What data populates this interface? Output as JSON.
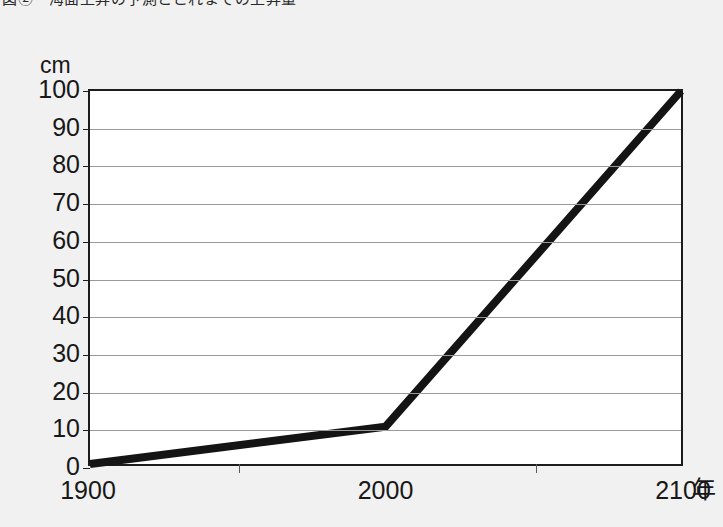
{
  "caption": {
    "text": "図②　海面上昇の予測とこれまでの上昇量"
  },
  "chart_data": {
    "type": "line",
    "title": "",
    "subtitle": "",
    "xlabel": "年",
    "ylabel": "cm",
    "x": [
      1900,
      2000,
      2100
    ],
    "values": [
      0,
      10,
      100
    ],
    "series": [
      {
        "name": "海面上昇量",
        "values": [
          0,
          10,
          100
        ]
      }
    ],
    "xlim": [
      1900,
      2100
    ],
    "ylim": [
      0,
      100
    ],
    "xticks": [
      1900,
      2000,
      2100
    ],
    "xtick_labels": [
      "1900",
      "2000",
      "2100"
    ],
    "xminor_ticks": [
      1950,
      2050
    ],
    "yticks": [
      0,
      10,
      20,
      30,
      40,
      50,
      60,
      70,
      80,
      90,
      100
    ],
    "ytick_labels": [
      "0",
      "10",
      "20",
      "30",
      "40",
      "50",
      "60",
      "70",
      "80",
      "90",
      "100"
    ],
    "grid": true,
    "grid_axis": "y",
    "legend": false,
    "legend_position": "none",
    "line_color": "#141414",
    "line_width": 8,
    "grid_color": "#9a9a9a",
    "frame_color": "#1c1c1c",
    "plot_background": "#ffffff",
    "figure_background": "#f1f1f1",
    "annotations": []
  }
}
